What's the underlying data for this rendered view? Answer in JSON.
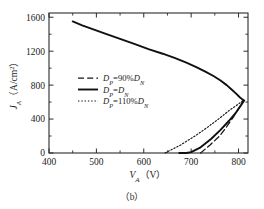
{
  "figure": {
    "caption": "（b）"
  },
  "chart_data": {
    "type": "line",
    "title": "",
    "xlabel": "V",
    "xlabel_sub": "A",
    "xlabel_unit": "（V）",
    "ylabel": "J",
    "ylabel_sub": "A",
    "ylabel_unit": "（A/cm",
    "ylabel_unit_sup": "2",
    "ylabel_unit_end": "）",
    "xlim": [
      400,
      820
    ],
    "ylim": [
      0,
      1650
    ],
    "xticks": [
      400,
      500,
      600,
      700,
      800
    ],
    "xtick_labels": [
      "400",
      "500",
      "600",
      "700",
      "800"
    ],
    "yticks": [
      0,
      400,
      800,
      1200,
      1600
    ],
    "ytick_labels": [
      "0",
      "400",
      "800",
      "1200",
      "1600"
    ],
    "x_minor_step": 50,
    "y_minor_step": 200,
    "grid": false,
    "legend_position": "center-left-inside",
    "axis_color": "#2b2b2b",
    "series": [
      {
        "name": "D_P=90%D_N",
        "label_main": "D",
        "label_sub1": "P",
        "label_mid": "=90%",
        "label_main2": "D",
        "label_sub2": "N",
        "style": "dashed",
        "color": "#151515",
        "points": [
          [
            720,
            0
          ],
          [
            740,
            95
          ],
          [
            760,
            200
          ],
          [
            775,
            310
          ],
          [
            790,
            430
          ],
          [
            800,
            520
          ],
          [
            806,
            575
          ],
          [
            810,
            620
          ]
        ]
      },
      {
        "name": "D_P=D_N",
        "label_main": "D",
        "label_sub1": "P",
        "label_mid": "=",
        "label_main2": "D",
        "label_sub2": "N",
        "style": "solid",
        "color": "#101010",
        "points": [
          [
            450,
            1550
          ],
          [
            470,
            1505
          ],
          [
            495,
            1455
          ],
          [
            520,
            1405
          ],
          [
            550,
            1345
          ],
          [
            580,
            1285
          ],
          [
            610,
            1225
          ],
          [
            640,
            1170
          ],
          [
            665,
            1120
          ],
          [
            690,
            1065
          ],
          [
            712,
            1010
          ],
          [
            730,
            960
          ],
          [
            748,
            905
          ],
          [
            762,
            855
          ],
          [
            775,
            800
          ],
          [
            786,
            745
          ],
          [
            795,
            700
          ],
          [
            802,
            660
          ],
          [
            808,
            632
          ],
          [
            812,
            618
          ],
          [
            806,
            570
          ],
          [
            795,
            480
          ],
          [
            780,
            380
          ],
          [
            762,
            272
          ],
          [
            742,
            165
          ],
          [
            718,
            60
          ],
          [
            700,
            10
          ],
          [
            690,
            0
          ],
          [
            675,
            0
          ]
        ]
      },
      {
        "name": "D_P=110%D_N",
        "label_main": "D",
        "label_sub1": "P",
        "label_mid": "=110%",
        "label_main2": "D",
        "label_sub2": "N",
        "style": "dotted",
        "color": "#151515",
        "points": [
          [
            645,
            0
          ],
          [
            678,
            95
          ],
          [
            708,
            200
          ],
          [
            735,
            305
          ],
          [
            760,
            410
          ],
          [
            780,
            500
          ],
          [
            798,
            570
          ],
          [
            810,
            620
          ]
        ]
      }
    ],
    "upper_branch_note": "All three series share the same upper branch from (450,1550) to the knee at (810,620)"
  }
}
